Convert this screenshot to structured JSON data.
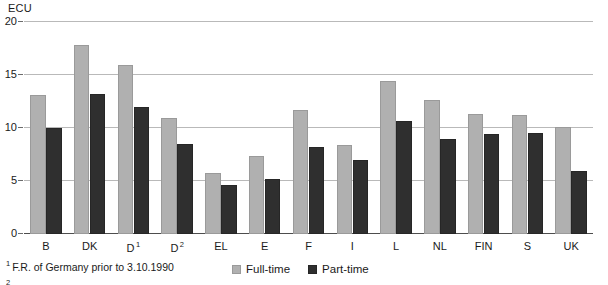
{
  "chart_data": {
    "type": "bar",
    "title": "",
    "subtitle": "",
    "unit_label": "ECU",
    "xlabel": "",
    "ylabel": "",
    "ylim": [
      0,
      20
    ],
    "yticks": [
      0,
      5,
      10,
      15,
      20
    ],
    "ytick_labels": [
      "0",
      "5",
      "10",
      "15",
      "20"
    ],
    "grid": true,
    "legend_position": "bottom-center",
    "categories": [
      "B",
      "DK",
      "D",
      "D",
      "EL",
      "E",
      "F",
      "I",
      "L",
      "NL",
      "FIN",
      "S",
      "UK"
    ],
    "category_labels": [
      {
        "text": "B",
        "sup": ""
      },
      {
        "text": "DK",
        "sup": ""
      },
      {
        "text": "D",
        "sup": "1"
      },
      {
        "text": "D",
        "sup": "2"
      },
      {
        "text": "EL",
        "sup": ""
      },
      {
        "text": "E",
        "sup": ""
      },
      {
        "text": "F",
        "sup": ""
      },
      {
        "text": "I",
        "sup": ""
      },
      {
        "text": "L",
        "sup": ""
      },
      {
        "text": "NL",
        "sup": ""
      },
      {
        "text": "FIN",
        "sup": ""
      },
      {
        "text": "S",
        "sup": ""
      },
      {
        "text": "UK",
        "sup": ""
      }
    ],
    "series": [
      {
        "name": "Full-time",
        "color": "#b0b0b0",
        "values": [
          13.1,
          17.8,
          15.9,
          10.9,
          5.8,
          7.4,
          11.7,
          8.4,
          14.4,
          12.6,
          11.3,
          11.2,
          10.1
        ]
      },
      {
        "name": "Part-time",
        "color": "#2f2f2f",
        "values": [
          10.0,
          13.2,
          12.0,
          8.5,
          4.6,
          5.2,
          8.2,
          7.0,
          10.7,
          9.0,
          9.4,
          9.5,
          5.9
        ]
      }
    ]
  },
  "legend": {
    "items": [
      {
        "label": "Full-time",
        "swatch": "full"
      },
      {
        "label": "Part-time",
        "swatch": "part"
      }
    ]
  },
  "footnotes": [
    {
      "marker": "1",
      "text": "F.R. of Germany prior to 3.10.1990"
    },
    {
      "marker": "2",
      "text": ""
    }
  ]
}
